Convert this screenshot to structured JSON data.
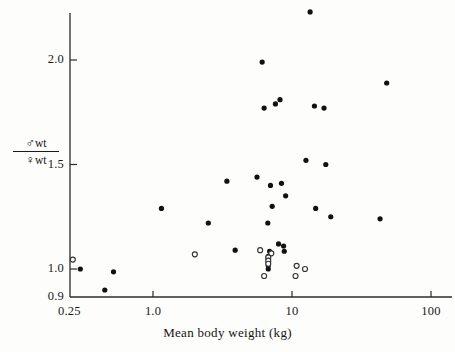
{
  "figure": {
    "background": "#fdfdfc",
    "ink": "#141414",
    "marker_fill_color": "#111111",
    "marker_open_color": "#ffffff",
    "marker_open_stroke": "#333333"
  },
  "axes": {
    "x_title": "Mean body weight (kg)",
    "y_title_numerator_symbol": "♂",
    "y_title_numerator_text": "wt",
    "y_title_denominator_symbol": "♀",
    "y_title_denominator_text": "wt",
    "x_tick_labels": [
      "0.25",
      "1.0",
      "10",
      "100"
    ],
    "y_tick_labels": [
      "2.0",
      "1.5",
      "1.0",
      "0.9"
    ]
  },
  "chart_data": {
    "type": "scatter",
    "title": "",
    "xlabel": "Mean body weight (kg)",
    "ylabel": "male wt / female wt",
    "xscale": "log",
    "yscale": "linear",
    "xlim": [
      0.25,
      120
    ],
    "ylim": [
      0.9,
      2.25
    ],
    "xticks": [
      0.25,
      1.0,
      10,
      100
    ],
    "xticklabels": [
      "0.25",
      "1.0",
      "10",
      "100"
    ],
    "yticks": [
      0.9,
      1.0,
      1.5,
      2.0
    ],
    "yticklabels": [
      "0.9",
      "1.0",
      "1.5",
      "2.0"
    ],
    "grid": false,
    "legend": null,
    "series": [
      {
        "name": "filled",
        "marker": "filled-circle",
        "color": "#111111",
        "points": [
          {
            "x": 13.5,
            "y": 2.23
          },
          {
            "x": 6.1,
            "y": 1.99
          },
          {
            "x": 48.0,
            "y": 1.89
          },
          {
            "x": 8.2,
            "y": 1.81
          },
          {
            "x": 7.6,
            "y": 1.79
          },
          {
            "x": 6.3,
            "y": 1.77
          },
          {
            "x": 14.5,
            "y": 1.78
          },
          {
            "x": 17.0,
            "y": 1.77
          },
          {
            "x": 12.6,
            "y": 1.52
          },
          {
            "x": 17.5,
            "y": 1.5
          },
          {
            "x": 5.6,
            "y": 1.44
          },
          {
            "x": 3.4,
            "y": 1.42
          },
          {
            "x": 8.4,
            "y": 1.41
          },
          {
            "x": 7.0,
            "y": 1.4
          },
          {
            "x": 9.0,
            "y": 1.35
          },
          {
            "x": 7.2,
            "y": 1.3
          },
          {
            "x": 1.15,
            "y": 1.29
          },
          {
            "x": 14.8,
            "y": 1.29
          },
          {
            "x": 19.0,
            "y": 1.25
          },
          {
            "x": 43.0,
            "y": 1.24
          },
          {
            "x": 2.5,
            "y": 1.22
          },
          {
            "x": 6.7,
            "y": 1.22
          },
          {
            "x": 8.0,
            "y": 1.12
          },
          {
            "x": 8.7,
            "y": 1.11
          },
          {
            "x": 3.9,
            "y": 1.09
          },
          {
            "x": 8.8,
            "y": 1.085
          },
          {
            "x": 6.9,
            "y": 1.085
          },
          {
            "x": 6.75,
            "y": 1.06
          },
          {
            "x": 6.75,
            "y": 1.045
          },
          {
            "x": 6.75,
            "y": 1.03
          },
          {
            "x": 6.75,
            "y": 1.015
          },
          {
            "x": 6.75,
            "y": 1.0
          },
          {
            "x": 0.3,
            "y": 1.0
          },
          {
            "x": 0.52,
            "y": 0.99
          },
          {
            "x": 0.45,
            "y": 0.925
          }
        ]
      },
      {
        "name": "open",
        "marker": "open-circle",
        "color": "#ffffff",
        "points": [
          {
            "x": 0.265,
            "y": 1.045
          },
          {
            "x": 2.0,
            "y": 1.07
          },
          {
            "x": 5.9,
            "y": 1.09
          },
          {
            "x": 7.1,
            "y": 1.075
          },
          {
            "x": 6.75,
            "y": 1.055
          },
          {
            "x": 6.75,
            "y": 1.04
          },
          {
            "x": 6.75,
            "y": 1.025
          },
          {
            "x": 6.3,
            "y": 0.975
          },
          {
            "x": 10.8,
            "y": 1.015
          },
          {
            "x": 12.4,
            "y": 1.0
          },
          {
            "x": 10.6,
            "y": 0.975
          }
        ]
      }
    ]
  },
  "geometry": {
    "plot_left_px": 70,
    "plot_bottom_px": 297,
    "plot_top_px": 13,
    "plot_right_px": 452,
    "x_px_at_1kg": 153,
    "px_per_decade": 139,
    "y_px_at_1_0": 269,
    "y_px_at_2_0": 60,
    "y_px_at_0_9": 297
  }
}
